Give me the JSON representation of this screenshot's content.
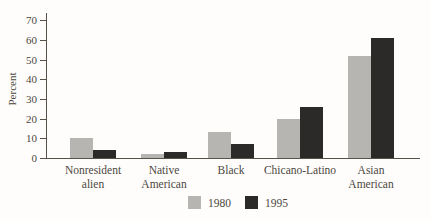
{
  "figure": {
    "ylabel": "Percent",
    "legend": {
      "items": [
        {
          "label": "1980",
          "color": "#b6b5b2"
        },
        {
          "label": "1995",
          "color": "#2b2a28"
        }
      ]
    }
  },
  "chart_data": {
    "type": "bar",
    "title": "",
    "xlabel": "",
    "ylabel": "Percent",
    "ylim": [
      0,
      70
    ],
    "yticks": [
      0,
      10,
      20,
      30,
      40,
      50,
      60,
      70
    ],
    "grid": false,
    "legend_position": "bottom-center",
    "categories": [
      "Nonresident alien",
      "Native American",
      "Black",
      "Chicano-Latino",
      "Asian American"
    ],
    "category_label_lines": [
      [
        "Nonresident",
        "alien"
      ],
      [
        "Native",
        "American"
      ],
      [
        "Black"
      ],
      [
        "Chicano-Latino"
      ],
      [
        "Asian",
        "American"
      ]
    ],
    "series": [
      {
        "name": "1980",
        "color": "#b6b5b2",
        "values": [
          10,
          2,
          13,
          20,
          52
        ]
      },
      {
        "name": "1995",
        "color": "#2b2a28",
        "values": [
          4,
          3,
          7,
          26,
          61
        ]
      }
    ]
  }
}
